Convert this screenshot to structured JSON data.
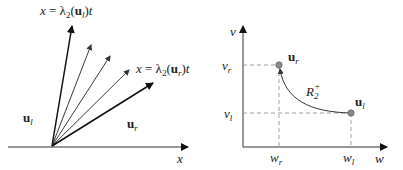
{
  "left_panel": {
    "title": "Rarefaction fan in x-t plane",
    "top_label": "x = λ₂(uₗ)t",
    "top_label_parts": {
      "lhs": "x = λ",
      "sub": "2",
      "arg": "(u",
      "argsub": "l",
      "end": ")t"
    },
    "right_label_parts": {
      "lhs": "x = λ",
      "sub": "2",
      "arg": "(u",
      "argsub": "r",
      "end": ")t"
    },
    "left_state": {
      "base": "u",
      "sub": "l"
    },
    "right_state": {
      "base": "u",
      "sub": "r"
    },
    "axis_label": "x",
    "fan_rays": 5
  },
  "right_panel": {
    "title": "Phase plane",
    "y_axis_label": "v",
    "x_axis_label": "w",
    "v_r": {
      "base": "v",
      "sub": "r"
    },
    "v_l": {
      "base": "v",
      "sub": "l"
    },
    "w_r": {
      "base": "w",
      "sub": "r"
    },
    "w_l": {
      "base": "w",
      "sub": "l"
    },
    "point_r": {
      "base": "u",
      "sub": "r"
    },
    "point_l": {
      "base": "u",
      "sub": "l"
    },
    "curve_label": {
      "base": "R",
      "sub": "2",
      "sup": "+"
    },
    "point_color": "#8a8a8a",
    "curve_color": "#333333"
  }
}
